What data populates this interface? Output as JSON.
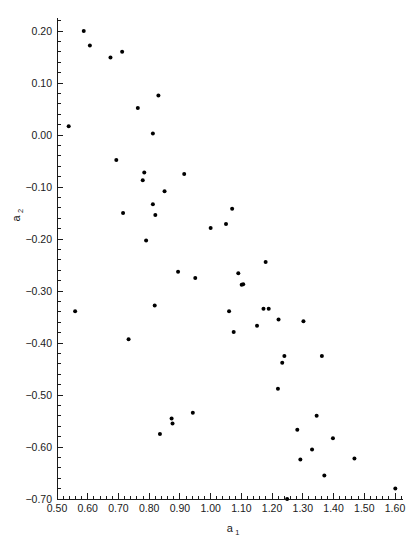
{
  "chart_data": {
    "type": "scatter",
    "title": "",
    "xlabel": "a_1",
    "ylabel": "a_2",
    "xlabel_base": "a",
    "xlabel_sub": "1",
    "ylabel_base": "a",
    "ylabel_sub": "2",
    "xlim": [
      0.5,
      1.625
    ],
    "ylim": [
      -0.7,
      0.225
    ],
    "xticks": [
      0.5,
      0.6,
      0.7,
      0.8,
      0.9,
      1.0,
      1.1,
      1.2,
      1.3,
      1.4,
      1.5,
      1.6
    ],
    "xtick_labels": [
      "0.50",
      "0.60",
      "0.70",
      "0.80",
      "0.90",
      "1.00",
      "1.10",
      "1.20",
      "1.30",
      "1.40",
      "1.50",
      "1.60"
    ],
    "yticks": [
      0.2,
      0.1,
      0.0,
      -0.1,
      -0.2,
      -0.3,
      -0.4,
      -0.5,
      -0.6,
      -0.7
    ],
    "ytick_labels": [
      "0.20",
      "0.10",
      "0.00",
      "−0.10",
      "−0.20",
      "−0.30",
      "−0.40",
      "−0.50",
      "−0.60",
      "−0.70"
    ],
    "xminor_step": 0.02,
    "yminor_step": 0.02,
    "grid": false,
    "legend": false,
    "marker": "filled-circle",
    "marker_color": "#000000",
    "marker_size_px": 3.0,
    "point_count": 53,
    "points": [
      {
        "x": 0.538,
        "y": 0.017
      },
      {
        "x": 0.559,
        "y": -0.339
      },
      {
        "x": 0.587,
        "y": 0.2
      },
      {
        "x": 0.607,
        "y": 0.172
      },
      {
        "x": 0.674,
        "y": 0.149
      },
      {
        "x": 0.693,
        "y": -0.048
      },
      {
        "x": 0.712,
        "y": 0.16
      },
      {
        "x": 0.715,
        "y": -0.15
      },
      {
        "x": 0.733,
        "y": -0.393
      },
      {
        "x": 0.763,
        "y": 0.052
      },
      {
        "x": 0.779,
        "y": -0.087
      },
      {
        "x": 0.784,
        "y": -0.072
      },
      {
        "x": 0.79,
        "y": -0.203
      },
      {
        "x": 0.812,
        "y": -0.133
      },
      {
        "x": 0.818,
        "y": -0.328
      },
      {
        "x": 0.82,
        "y": -0.154
      },
      {
        "x": 0.83,
        "y": 0.076
      },
      {
        "x": 0.835,
        "y": -0.575
      },
      {
        "x": 0.85,
        "y": -0.108
      },
      {
        "x": 0.873,
        "y": -0.545
      },
      {
        "x": 0.894,
        "y": -0.263
      },
      {
        "x": 0.914,
        "y": -0.075
      },
      {
        "x": 0.942,
        "y": -0.534
      },
      {
        "x": 0.95,
        "y": -0.275
      },
      {
        "x": 1.0,
        "y": -0.179
      },
      {
        "x": 1.05,
        "y": -0.171
      },
      {
        "x": 1.06,
        "y": -0.339
      },
      {
        "x": 1.07,
        "y": -0.142
      },
      {
        "x": 1.075,
        "y": -0.379
      },
      {
        "x": 1.09,
        "y": -0.266
      },
      {
        "x": 1.101,
        "y": -0.288
      },
      {
        "x": 1.151,
        "y": -0.367
      },
      {
        "x": 1.172,
        "y": -0.334
      },
      {
        "x": 1.179,
        "y": -0.244
      },
      {
        "x": 1.219,
        "y": -0.488
      },
      {
        "x": 1.221,
        "y": -0.355
      },
      {
        "x": 1.233,
        "y": -0.438
      },
      {
        "x": 1.24,
        "y": -0.425
      },
      {
        "x": 1.249,
        "y": -0.7
      },
      {
        "x": 1.282,
        "y": -0.567
      },
      {
        "x": 1.292,
        "y": -0.624
      },
      {
        "x": 1.302,
        "y": -0.358
      },
      {
        "x": 1.33,
        "y": -0.605
      },
      {
        "x": 1.345,
        "y": -0.54
      },
      {
        "x": 1.362,
        "y": -0.425
      },
      {
        "x": 1.37,
        "y": -0.655
      },
      {
        "x": 1.398,
        "y": -0.583
      },
      {
        "x": 1.468,
        "y": -0.622
      },
      {
        "x": 1.601,
        "y": -0.68
      },
      {
        "x": 0.812,
        "y": 0.003
      },
      {
        "x": 1.189,
        "y": -0.334
      },
      {
        "x": 0.876,
        "y": -0.555
      },
      {
        "x": 1.106,
        "y": -0.287
      }
    ]
  }
}
